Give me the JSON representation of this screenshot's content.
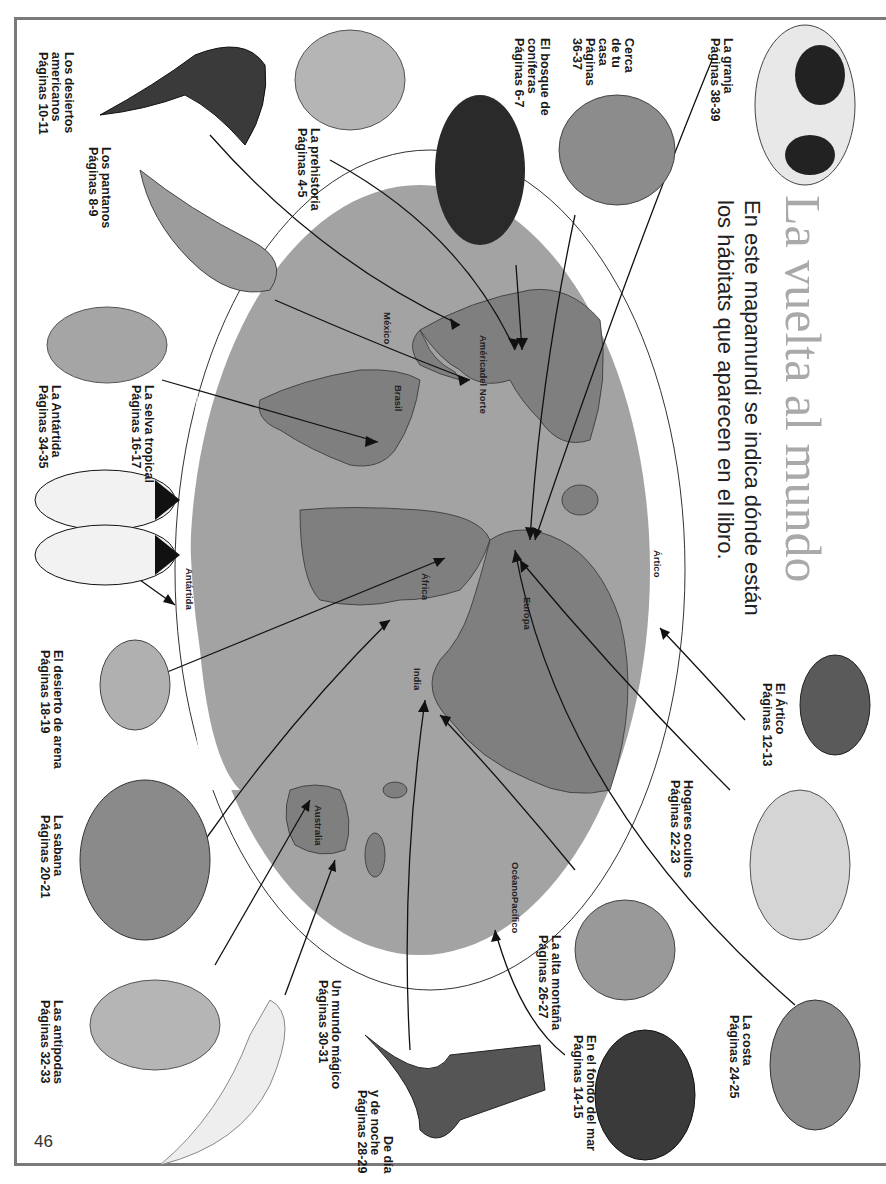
{
  "page": {
    "title": "La vuelta al mundo",
    "subtitle_line1": "En este mapamundi se indica dónde están",
    "subtitle_line2": "los hábitats que aparecen en el libro.",
    "page_number": "46"
  },
  "colors": {
    "ocean": "#a3a3a3",
    "land": "#7f7f7f",
    "frame": "#7a7a7a",
    "title": "#a9a9a9"
  },
  "habitats": [
    {
      "name": "Los desiertos americanos",
      "lines": [
        "Los desiertos",
        "americanos",
        "Páginas 10-11"
      ],
      "animal": "gila-monster"
    },
    {
      "name": "Los pantanos",
      "lines": [
        "Los pantanos",
        "Páginas 8-9"
      ],
      "animal": "manatee"
    },
    {
      "name": "La prehistoria",
      "lines": [
        "La prehistoria",
        "Páginas 4-5"
      ],
      "animal": "triceratops"
    },
    {
      "name": "El bosque de coníferas",
      "lines": [
        "El bosque de",
        "coníferas",
        "Páginas 6-7"
      ],
      "animal": "wolverine"
    },
    {
      "name": "Cerca de tu casa",
      "lines": [
        "Cerca",
        "de tu",
        "casa",
        "Páginas",
        "36-37"
      ],
      "animal": "toad"
    },
    {
      "name": "La granja",
      "lines": [
        "La granja",
        "Páginas 38-39"
      ],
      "animal": "cow"
    },
    {
      "name": "La selva tropical",
      "lines": [
        "La selva tropical",
        "Páginas 16-17"
      ],
      "animal": "sloth"
    },
    {
      "name": "La Antártida",
      "lines": [
        "La Antártida",
        "Páginas 34-35"
      ],
      "animal": "penguin"
    },
    {
      "name": "El desierto de arena",
      "lines": [
        "El desierto de arena",
        "Páginas 18-19"
      ],
      "animal": "scorpion"
    },
    {
      "name": "La sabana",
      "lines": [
        "La sabana",
        "Páginas 20-21"
      ],
      "animal": "hippo"
    },
    {
      "name": "Las antípodas",
      "lines": [
        "Las antípodas",
        "Páginas 32-33"
      ],
      "animal": "kangaroo-rat"
    },
    {
      "name": "Un mundo mágico",
      "lines": [
        "Un mundo mágico",
        "Páginas 30-31"
      ],
      "animal": "hammerhead-shark"
    },
    {
      "name": "De día y de noche",
      "lines": [
        "De día",
        "y de noche",
        "Páginas 28-29"
      ],
      "animal": "cobra"
    },
    {
      "name": "La alta montaña",
      "lines": [
        "La alta montaña",
        "Páginas 26-27"
      ],
      "animal": "pika"
    },
    {
      "name": "En el fondo del mar",
      "lines": [
        "En el fondo del mar",
        "Páginas 14-15"
      ],
      "animal": "anglerfish"
    },
    {
      "name": "La costa",
      "lines": [
        "La costa",
        "Páginas 24-25"
      ],
      "animal": "hermit-crab"
    },
    {
      "name": "Hogares ocultos",
      "lines": [
        "Hogares ocultos",
        "Páginas 22-23"
      ],
      "animal": "deer"
    },
    {
      "name": "El Ártico",
      "lines": [
        "El Ártico",
        "Páginas 12-13"
      ],
      "animal": "lemming"
    }
  ],
  "map_labels": {
    "mexico": "México",
    "north_america": [
      "América",
      "del Norte"
    ],
    "brazil": "Brasil",
    "africa": "África",
    "europe": "Europa",
    "india": "India",
    "australia": "Australia",
    "pacific": [
      "Océano",
      "Pacífico"
    ],
    "arctic": "Ártico",
    "antarctica": "Antártida"
  }
}
